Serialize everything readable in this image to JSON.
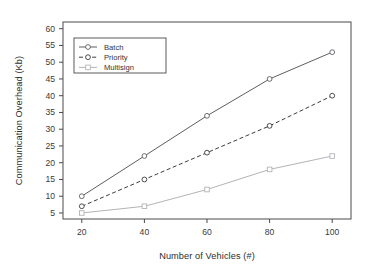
{
  "chart_data": {
    "type": "line",
    "title": "",
    "xlabel": "Number of Vehicles (#)",
    "ylabel": "Communication Overhead (Kb)",
    "x": [
      20,
      40,
      60,
      80,
      100
    ],
    "xtick_labels": [
      "20",
      "40",
      "60",
      "80",
      "100"
    ],
    "ytick_labels": [
      "5",
      "10",
      "15",
      "20",
      "25",
      "30",
      "35",
      "40",
      "45",
      "50",
      "55",
      "60"
    ],
    "ytick_values": [
      5,
      10,
      15,
      20,
      25,
      30,
      35,
      40,
      45,
      50,
      55,
      60
    ],
    "xlim": [
      14,
      106
    ],
    "ylim": [
      3.2,
      62
    ],
    "grid": false,
    "legend_position": "upper-left-inside",
    "series": [
      {
        "name": "Batch",
        "values": [
          10,
          22,
          34,
          45,
          53
        ],
        "color": "#5d5d63",
        "dash": "none",
        "marker": "circle"
      },
      {
        "name": "Priority",
        "values": [
          7,
          15,
          23,
          31,
          40
        ],
        "color": "#3a3a40",
        "dash": "dashed",
        "marker": "circle"
      },
      {
        "name": "Multisign",
        "values": [
          5,
          7,
          12,
          18,
          22
        ],
        "color": "#b4b4b8",
        "dash": "none",
        "marker": "square"
      }
    ]
  },
  "legend": {
    "entries": [
      "Batch",
      "Priority",
      "Multisign"
    ]
  },
  "axes": {
    "x_title": "Number of Vehicles (#)",
    "y_title": "Communication Overhead (Kb)"
  }
}
